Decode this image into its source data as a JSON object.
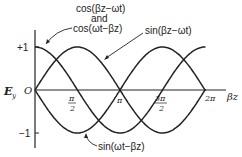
{
  "chart_data": {
    "type": "line",
    "title": "",
    "xlabel": "βz",
    "ylabel": "E_y",
    "x_ticks": [
      "π/2",
      "π",
      "3π/2",
      "2π"
    ],
    "y_ticks": [
      "+1",
      "O",
      "-1"
    ],
    "xlim": [
      0,
      6.3
    ],
    "ylim": [
      -1,
      1
    ],
    "series": [
      {
        "name": "cos(βz-ωt) and cos(ωt-βz)",
        "function": "cos(x)",
        "x": [
          0,
          1.571,
          3.142,
          4.712,
          6.283
        ],
        "values": [
          1,
          0,
          -1,
          0,
          1
        ]
      },
      {
        "name": "sin(βz-ωt)",
        "function": "sin(x)",
        "x": [
          0,
          1.571,
          3.142,
          4.712,
          6.283
        ],
        "values": [
          0,
          1,
          0,
          -1,
          0
        ]
      },
      {
        "name": "sin(ωt-βz)",
        "function": "-sin(x)",
        "x": [
          0,
          1.571,
          3.142,
          4.712,
          6.283
        ],
        "values": [
          0,
          -1,
          0,
          1,
          0
        ]
      }
    ]
  },
  "labels": {
    "cos_line1": "cos(βz−ωt)",
    "cos_and": "and",
    "cos_line2": "cos(ωt−βz)",
    "sin_pos": "sin(βz−ωt)",
    "sin_neg": "sin(ωt−βz)",
    "ylabel": "E",
    "ylabel_sub": "y",
    "xlabel": "βz",
    "origin": "O",
    "plus1": "+1",
    "minus1": "−1",
    "tick_pi_half_num": "π",
    "tick_pi_half_den": "2",
    "tick_pi": "π",
    "tick_3pi_half_num": "3π",
    "tick_3pi_half_den": "2",
    "tick_2pi": "2π"
  }
}
